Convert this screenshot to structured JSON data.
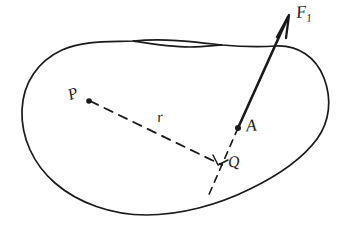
{
  "figure": {
    "style": "hand-drawn line sketch",
    "background_color": "#ffffff",
    "ink_color": "#1a1a1a",
    "labels": {
      "force": "F",
      "force_subscript": "1",
      "application_point": "A",
      "reference_point": "P",
      "foot_of_perpendicular": "Q",
      "moment_arm": "r"
    },
    "elements": {
      "body_outline": "closed irregular blob representing a rigid body",
      "force_vector": "solid arrow from A pointing up and to the right labeled F1",
      "moment_arm_line": "dashed segment from P to Q labeled r",
      "line_of_action": "dashed line through Q along the direction of F1",
      "right_angle_mark": "small square tick at Q indicating perpendicularity",
      "point_markers": "filled dots at P and A"
    }
  }
}
